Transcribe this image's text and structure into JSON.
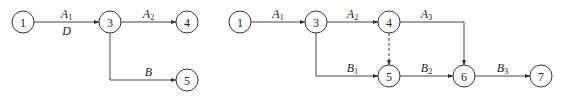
{
  "diagrams": [
    {
      "id": "left",
      "nodes": [
        "1",
        "3",
        "4",
        "5"
      ],
      "edges": [
        {
          "from": "1",
          "to": "3",
          "label": "A",
          "sub": "1",
          "label2": "D"
        },
        {
          "from": "3",
          "to": "4",
          "label": "A",
          "sub": "2"
        },
        {
          "from": "3",
          "to": "5",
          "label": "B",
          "sub": ""
        }
      ]
    },
    {
      "id": "right",
      "nodes": [
        "1",
        "3",
        "4",
        "5",
        "6",
        "7"
      ],
      "edges": [
        {
          "from": "1",
          "to": "3",
          "label": "A",
          "sub": "1"
        },
        {
          "from": "3",
          "to": "4",
          "label": "A",
          "sub": "2"
        },
        {
          "from": "4",
          "to": "6",
          "label": "A",
          "sub": "3"
        },
        {
          "from": "4",
          "to": "5",
          "label": "",
          "sub": "",
          "dashed": true
        },
        {
          "from": "3",
          "to": "5",
          "label": "B",
          "sub": "1"
        },
        {
          "from": "5",
          "to": "6",
          "label": "B",
          "sub": "2"
        },
        {
          "from": "6",
          "to": "7",
          "label": "B",
          "sub": "3"
        }
      ]
    }
  ]
}
